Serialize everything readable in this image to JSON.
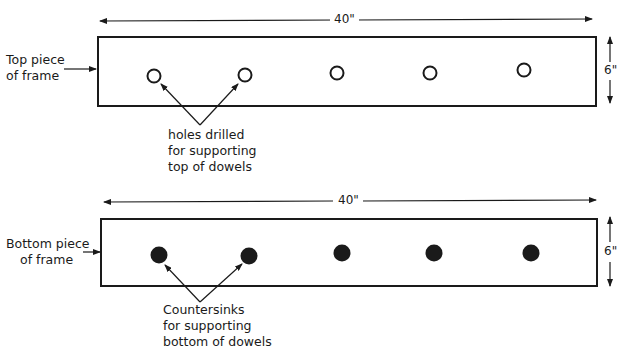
{
  "diagram": {
    "top_piece": {
      "side_label_line1": "Top piece",
      "side_label_line2": "of frame",
      "width_dimension": "40\"",
      "height_dimension": "6\"",
      "hole_type": "open-circle",
      "hole_count": 5,
      "callout_line1": "holes drilled",
      "callout_line2": "for supporting",
      "callout_line3": "top of dowels"
    },
    "bottom_piece": {
      "side_label_line1": "Bottom piece",
      "side_label_line2": "of frame",
      "width_dimension": "40\"",
      "height_dimension": "6\"",
      "hole_type": "filled-circle",
      "hole_count": 5,
      "callout_line1": "Countersinks",
      "callout_line2": "for supporting",
      "callout_line3": "bottom of dowels"
    },
    "colors": {
      "line": "#1a1a1a",
      "background": "#ffffff"
    }
  }
}
